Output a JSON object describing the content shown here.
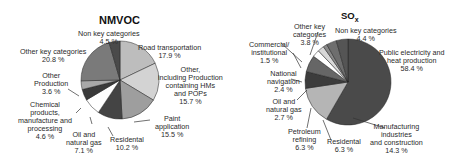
{
  "chart_data": [
    {
      "type": "pie",
      "title": "NMVOC",
      "slices": [
        {
          "label": "Road transportation",
          "value": 17.9,
          "color": "#bdbdbd"
        },
        {
          "label": "Other, including Production containing HMs and POPs",
          "value": 15.7,
          "color": "#d3d3d3"
        },
        {
          "label": "Paint application",
          "value": 15.5,
          "color": "#9e9e9e"
        },
        {
          "label": "Residental",
          "value": 10.2,
          "color": "#444444"
        },
        {
          "label": "Oil and natural gas",
          "value": 7.1,
          "color": "#ffffff"
        },
        {
          "label": "Chemical products, manufacture and processing",
          "value": 4.6,
          "color": "#3a3a3a"
        },
        {
          "label": "Other Production",
          "value": 3.6,
          "color": "#a8a8a8"
        },
        {
          "label": "Other key categories",
          "value": 20.8,
          "color": "#7a7a7a"
        },
        {
          "label": "Non key categories",
          "value": 4.5,
          "color": "#4a4a4a"
        }
      ]
    },
    {
      "type": "pie",
      "title": "SOx",
      "slices": [
        {
          "label": "Public electricity and heat production",
          "value": 58.4,
          "color": "#4a4a4a"
        },
        {
          "label": "Manufacturing industries and construction",
          "value": 14.3,
          "color": "#b5b5b5"
        },
        {
          "label": "Residental",
          "value": 6.3,
          "color": "#3c3c3c"
        },
        {
          "label": "Petroleum refining",
          "value": 6.3,
          "color": "#666666"
        },
        {
          "label": "Oil and natural gas",
          "value": 2.7,
          "color": "#ffffff"
        },
        {
          "label": "National navigation",
          "value": 2.4,
          "color": "#d8d8d8"
        },
        {
          "label": "Commercial/ institutional",
          "value": 1.5,
          "color": "#8a8a8a"
        },
        {
          "label": "Other key categories",
          "value": 3.8,
          "color": "#6e6e6e"
        },
        {
          "label": "Non key categories",
          "value": 4.4,
          "color": "#555555"
        }
      ]
    }
  ],
  "nmvoc": {
    "title": "NMVOC",
    "labels": {
      "non_key": [
        "Non key categories",
        "4.5 %"
      ],
      "road": [
        "Road transportation",
        "17.9 %"
      ],
      "other_incl": [
        "Other,",
        "including Production",
        "containing HMs",
        "and POPs",
        "15.7 %"
      ],
      "paint": [
        "Paint",
        "application",
        "15.5 %"
      ],
      "residental": [
        "Residental",
        "10.2 %"
      ],
      "oil": [
        "Oil and",
        "natural gas",
        "7.1 %"
      ],
      "chemical": [
        "Chemical",
        "products,",
        "manufacture and",
        "processing",
        "4.6 %"
      ],
      "other_prod": [
        "Other",
        "Production",
        "3.6 %"
      ],
      "other_key": [
        "Other key categories",
        "20.8 %"
      ]
    }
  },
  "sox": {
    "title_main": "SO",
    "title_sub": "x",
    "labels": {
      "other_key": [
        "Other key",
        "categories",
        "3.8 %"
      ],
      "non_key": [
        "Non key categories",
        "4.4 %"
      ],
      "commercial": [
        "Commercial/",
        "institutional",
        "1.5 %"
      ],
      "public": [
        "Public electricity and",
        "heat production",
        "58.4 %"
      ],
      "national": [
        "National",
        "navigation",
        "2.4 %"
      ],
      "oil": [
        "Oil and",
        "natural gas",
        "2.7 %"
      ],
      "petroleum": [
        "Petroleum",
        "refining",
        "6.3 %"
      ],
      "residental": [
        "Residental",
        "6.3 %"
      ],
      "manufacturing": [
        "Manufacturing",
        "industries",
        "and construction",
        "14.3 %"
      ]
    }
  }
}
